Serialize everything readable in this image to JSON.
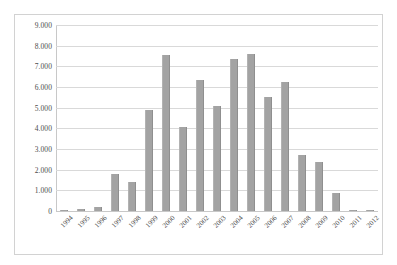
{
  "chart_data": {
    "type": "bar",
    "title": "",
    "subtitle": "",
    "xlabel": "",
    "ylabel": "",
    "ylim": [
      0,
      9000
    ],
    "ytick_labels": [
      "0",
      "1.000",
      "2.000",
      "3.000",
      "4.000",
      "5.000",
      "6.000",
      "7.000",
      "8.000",
      "9.000"
    ],
    "ytick_values": [
      0,
      1000,
      2000,
      3000,
      4000,
      5000,
      6000,
      7000,
      8000,
      9000
    ],
    "grid": true,
    "legend": null,
    "legend_position": "none",
    "annotations": [],
    "bar_color": "#a3a3a3",
    "gridline_color": "#d9d9d9",
    "axis_color": "#c8c8c8",
    "frame_color": "#d2d2d2",
    "categories": [
      "1994",
      "1995",
      "1996",
      "1997",
      "1998",
      "1999",
      "2000",
      "2001",
      "2002",
      "2003",
      "2004",
      "2005",
      "2006",
      "2007",
      "2008",
      "2009",
      "2010",
      "2011",
      "2012"
    ],
    "values": [
      20,
      120,
      180,
      1790,
      1400,
      4870,
      7540,
      4080,
      6340,
      5090,
      7370,
      7620,
      5530,
      6220,
      2690,
      2350,
      860,
      50,
      20
    ]
  }
}
